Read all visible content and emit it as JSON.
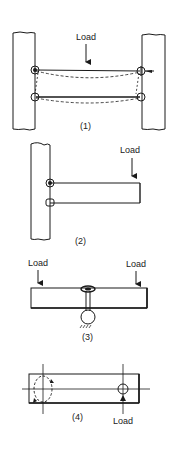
{
  "figure": {
    "panels": [
      {
        "id": "1",
        "caption": "(1)",
        "load_labels": [
          "Load"
        ],
        "description": "Bar bolted between two plates; load at center causes deflection (dashed)"
      },
      {
        "id": "2",
        "caption": "(2)",
        "load_labels": [
          "Load"
        ],
        "description": "Cantilever bar bolted to one plate with load at free end"
      },
      {
        "id": "3",
        "caption": "(3)",
        "load_labels": [
          "Load",
          "Load"
        ],
        "description": "Bar on a central bolt and pivot support with loads at both ends"
      },
      {
        "id": "4",
        "caption": "(4)",
        "load_labels": [
          "Load"
        ],
        "description": "Bar with two bolt holes; load at right hole causes rotation around left hole (dashed)"
      }
    ]
  },
  "colors": {
    "ink": "#1a1a1a",
    "background": "#ffffff"
  }
}
